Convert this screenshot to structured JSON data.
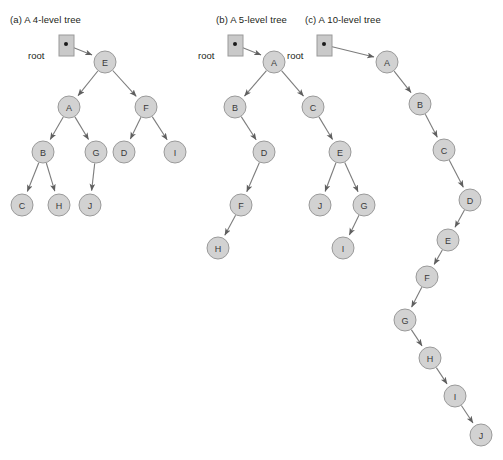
{
  "figure": {
    "background_color": "#ffffff",
    "node_fill_color": "#d2d2d2",
    "node_stroke_color": "#9a9a9a",
    "edge_color": "#7c7c7c",
    "root_box_fill": "#c9c9c9",
    "text_color": "#231f20"
  },
  "panels": [
    {
      "id": "panel-a",
      "caption": "(a) A 4-level tree",
      "caption_x": 10,
      "caption_y": 14,
      "root_label": "root",
      "root_label_x": 28,
      "root_label_y": 50,
      "root_box": {
        "x": 59,
        "y": 35,
        "w": 15,
        "h": 21,
        "dot_x": 66,
        "dot_y": 44
      },
      "root_arrow": {
        "x1": 67,
        "y1": 45,
        "x2": 92,
        "y2": 55
      },
      "nodes": [
        {
          "label": "E",
          "x": 105,
          "y": 62
        },
        {
          "label": "A",
          "x": 69,
          "y": 107
        },
        {
          "label": "F",
          "x": 146,
          "y": 107
        },
        {
          "label": "B",
          "x": 43,
          "y": 152
        },
        {
          "label": "G",
          "x": 96,
          "y": 152
        },
        {
          "label": "D",
          "x": 124,
          "y": 152
        },
        {
          "label": "I",
          "x": 175,
          "y": 152
        },
        {
          "label": "C",
          "x": 22,
          "y": 205
        },
        {
          "label": "H",
          "x": 59,
          "y": 205
        },
        {
          "label": "J",
          "x": 90,
          "y": 205
        }
      ],
      "edges": [
        {
          "from": "E",
          "to": "A"
        },
        {
          "from": "E",
          "to": "F"
        },
        {
          "from": "A",
          "to": "B"
        },
        {
          "from": "A",
          "to": "G"
        },
        {
          "from": "F",
          "to": "D"
        },
        {
          "from": "F",
          "to": "I"
        },
        {
          "from": "B",
          "to": "C"
        },
        {
          "from": "B",
          "to": "H"
        },
        {
          "from": "G",
          "to": "J"
        }
      ]
    },
    {
      "id": "panel-b",
      "caption": "(b) A 5-level tree",
      "caption_x": 216,
      "caption_y": 14,
      "root_label": "root",
      "root_label_x": 198,
      "root_label_y": 50,
      "root_box": {
        "x": 228,
        "y": 35,
        "w": 15,
        "h": 21,
        "dot_x": 235,
        "dot_y": 44
      },
      "root_arrow": {
        "x1": 236,
        "y1": 45,
        "x2": 261,
        "y2": 55
      },
      "nodes": [
        {
          "label": "A",
          "x": 274,
          "y": 62
        },
        {
          "label": "B",
          "x": 235,
          "y": 107
        },
        {
          "label": "C",
          "x": 313,
          "y": 107
        },
        {
          "label": "D",
          "x": 264,
          "y": 152
        },
        {
          "label": "E",
          "x": 340,
          "y": 152
        },
        {
          "label": "F",
          "x": 241,
          "y": 205
        },
        {
          "label": "J",
          "x": 320,
          "y": 205
        },
        {
          "label": "G",
          "x": 364,
          "y": 205
        },
        {
          "label": "H",
          "x": 218,
          "y": 248
        },
        {
          "label": "I",
          "x": 343,
          "y": 248
        }
      ],
      "edges": [
        {
          "from": "A",
          "to": "B"
        },
        {
          "from": "A",
          "to": "C"
        },
        {
          "from": "B",
          "to": "D"
        },
        {
          "from": "C",
          "to": "E"
        },
        {
          "from": "D",
          "to": "F"
        },
        {
          "from": "E",
          "to": "J"
        },
        {
          "from": "E",
          "to": "G"
        },
        {
          "from": "F",
          "to": "H"
        },
        {
          "from": "G",
          "to": "I"
        }
      ]
    },
    {
      "id": "panel-c",
      "caption": "(c) A 10-level tree",
      "caption_x": 305,
      "caption_y": 14,
      "root_label": "root",
      "root_label_x": 287,
      "root_label_y": 50,
      "root_box": {
        "x": 317,
        "y": 35,
        "w": 15,
        "h": 21,
        "dot_x": 324,
        "dot_y": 44
      },
      "root_arrow": {
        "x1": 325,
        "y1": 45,
        "x2": 374,
        "y2": 57
      },
      "nodes": [
        {
          "label": "A",
          "x": 387,
          "y": 62
        },
        {
          "label": "B",
          "x": 420,
          "y": 104
        },
        {
          "label": "C",
          "x": 444,
          "y": 150
        },
        {
          "label": "D",
          "x": 470,
          "y": 200
        },
        {
          "label": "E",
          "x": 448,
          "y": 240
        },
        {
          "label": "F",
          "x": 427,
          "y": 277
        },
        {
          "label": "G",
          "x": 405,
          "y": 320
        },
        {
          "label": "H",
          "x": 430,
          "y": 358
        },
        {
          "label": "I",
          "x": 455,
          "y": 396
        },
        {
          "label": "J",
          "x": 481,
          "y": 435
        }
      ],
      "edges": [
        {
          "from": "A",
          "to": "B"
        },
        {
          "from": "B",
          "to": "C"
        },
        {
          "from": "C",
          "to": "D"
        },
        {
          "from": "D",
          "to": "E"
        },
        {
          "from": "E",
          "to": "F"
        },
        {
          "from": "F",
          "to": "G"
        },
        {
          "from": "G",
          "to": "H"
        },
        {
          "from": "H",
          "to": "I"
        },
        {
          "from": "I",
          "to": "J"
        }
      ]
    }
  ],
  "node_radius": 11
}
